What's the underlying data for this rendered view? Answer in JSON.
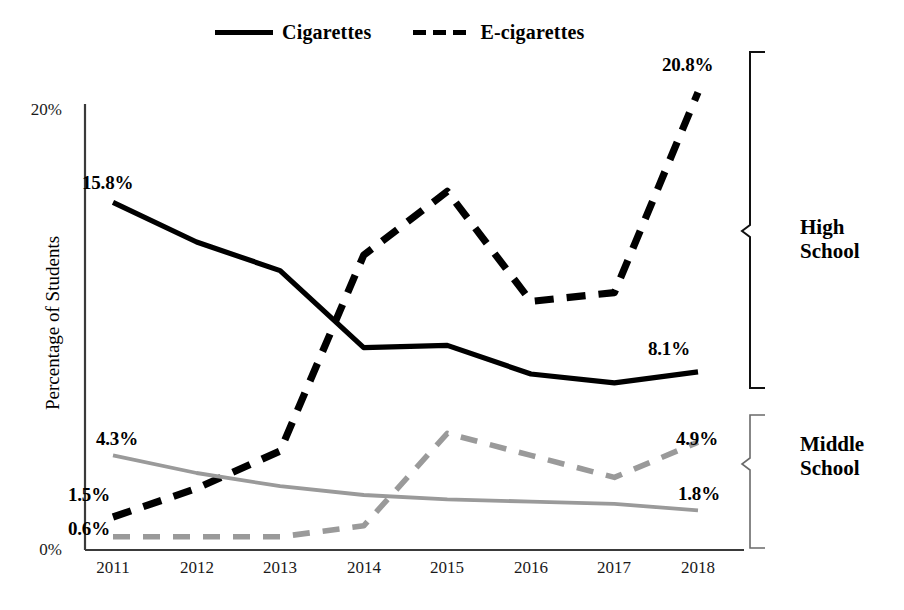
{
  "legend": {
    "entries": [
      {
        "label": "Cigarettes",
        "style": "solid",
        "color": "#000000"
      },
      {
        "label": "E-cigarettes",
        "style": "dashed",
        "color": "#000000"
      }
    ]
  },
  "axes": {
    "ylabel": "Percentage of Students",
    "yticks": [
      "20%",
      "0%"
    ],
    "xticks": [
      "2011",
      "2012",
      "2013",
      "2014",
      "2015",
      "2016",
      "2017",
      "2018"
    ]
  },
  "annotations": {
    "hs_cig_start": "15.8%",
    "hs_cig_end": "8.1%",
    "hs_ecig_start": "1.5%",
    "hs_ecig_end": "20.8%",
    "ms_cig_start": "4.3%",
    "ms_cig_end": "1.8%",
    "ms_ecig_start": "0.6%",
    "ms_ecig_end": "4.9%"
  },
  "groups": {
    "high_school": "High\nSchool",
    "high_school_line1": "High",
    "high_school_line2": "School",
    "middle_school_line1": "Middle",
    "middle_school_line2": "School"
  },
  "colors": {
    "high_school": "#000000",
    "middle_school": "#9a9a9a",
    "background": "#ffffff",
    "axis": "#3a3a3a"
  },
  "chart_data": {
    "type": "line",
    "title": "",
    "xlabel": "",
    "ylabel": "Percentage of Students",
    "x": [
      2011,
      2012,
      2013,
      2014,
      2015,
      2016,
      2017,
      2018
    ],
    "categories": [
      "2011",
      "2012",
      "2013",
      "2014",
      "2015",
      "2016",
      "2017",
      "2018"
    ],
    "ylim": [
      0,
      21.5
    ],
    "yticks": [
      0,
      20
    ],
    "grid": false,
    "legend_position": "top-center",
    "series": [
      {
        "name": "Cigarettes",
        "group": "High School",
        "style": "solid",
        "color": "#000000",
        "values": [
          15.8,
          14.0,
          12.7,
          9.2,
          9.3,
          8.0,
          7.6,
          8.1
        ],
        "labels": {
          "2011": "15.8%",
          "2018": "8.1%"
        }
      },
      {
        "name": "E-cigarettes",
        "group": "High School",
        "style": "dashed",
        "color": "#000000",
        "values": [
          1.5,
          2.8,
          4.5,
          13.4,
          16.3,
          11.3,
          11.7,
          20.8
        ],
        "labels": {
          "2011": "1.5%",
          "2018": "20.8%"
        }
      },
      {
        "name": "Cigarettes",
        "group": "Middle School",
        "style": "solid",
        "color": "#9a9a9a",
        "values": [
          4.3,
          3.5,
          2.9,
          2.5,
          2.3,
          2.2,
          2.1,
          1.8
        ],
        "labels": {
          "2011": "4.3%",
          "2018": "1.8%"
        }
      },
      {
        "name": "E-cigarettes",
        "group": "Middle School",
        "style": "dashed",
        "color": "#9a9a9a",
        "values": [
          0.6,
          0.6,
          0.6,
          1.1,
          5.3,
          4.3,
          3.3,
          4.9
        ],
        "labels": {
          "2011": "0.6%",
          "2018": "4.9%"
        }
      }
    ]
  }
}
